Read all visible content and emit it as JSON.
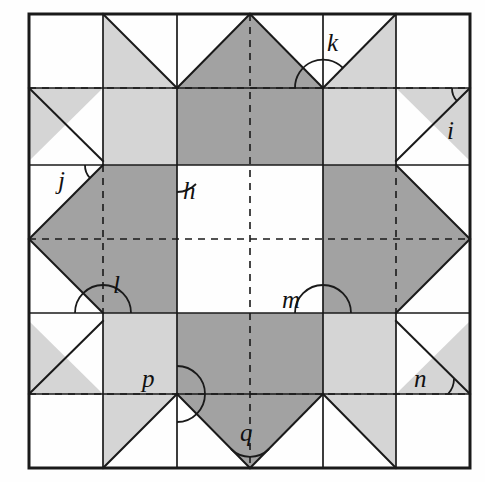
{
  "figure": {
    "grid": {
      "columns": 6,
      "rows": 6,
      "left": 29,
      "top": 14,
      "right": 470,
      "bottom": 468,
      "cell_size": 73.5,
      "solid_line_color": "#1a1a1a",
      "dashed_line_color": "#1a1a1a",
      "outer_border_width": 3,
      "inner_line_width": 1.6,
      "dash_pattern": "7 6"
    },
    "fills": {
      "light_gray": "#d5d5d5",
      "dark_gray": "#a2a2a2",
      "white": "#ffffff",
      "background": "#fefefe"
    },
    "angle_labels": [
      {
        "id": "h",
        "text": "h",
        "x": 183,
        "y": 178,
        "vertex_x": 177,
        "vertex_y": 165,
        "arc": "large"
      },
      {
        "id": "i",
        "text": "i",
        "x": 447,
        "y": 118,
        "vertex_x": 470,
        "vertex_y": 88,
        "arc": "small"
      },
      {
        "id": "j",
        "text": "j",
        "x": 58,
        "y": 168,
        "vertex_x": 103,
        "vertex_y": 165,
        "arc": "small"
      },
      {
        "id": "k",
        "text": "k",
        "x": 327,
        "y": 30,
        "vertex_x": 323,
        "vertex_y": 88,
        "arc": "large"
      },
      {
        "id": "l",
        "text": "l",
        "x": 113,
        "y": 272,
        "vertex_x": 103,
        "vertex_y": 313,
        "arc": "large"
      },
      {
        "id": "m",
        "text": "m",
        "x": 282,
        "y": 287,
        "vertex_x": 323,
        "vertex_y": 313,
        "arc": "large"
      },
      {
        "id": "n",
        "text": "n",
        "x": 414,
        "y": 366,
        "vertex_x": 470,
        "vertex_y": 394,
        "arc": "small"
      },
      {
        "id": "p",
        "text": "p",
        "x": 142,
        "y": 366,
        "vertex_x": 177,
        "vertex_y": 394,
        "arc": "large"
      },
      {
        "id": "q",
        "text": "q",
        "x": 240,
        "y": 420,
        "vertex_x": 250,
        "vertex_y": 468,
        "arc": "small"
      }
    ]
  }
}
